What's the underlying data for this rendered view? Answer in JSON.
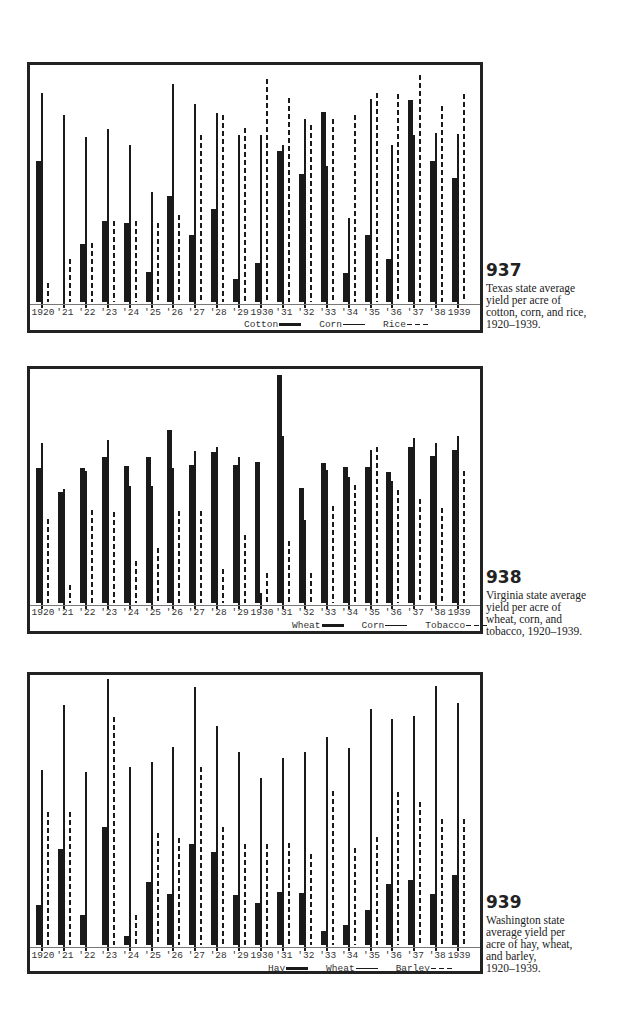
{
  "chart_data": [
    {
      "type": "bar",
      "id": "937",
      "title": "Texas state average yield per acre of cotton, corn, and rice, 1920–1939.",
      "categories": [
        "1920",
        "'21",
        "'22",
        "'23",
        "'24",
        "'25",
        "'26",
        "'27",
        "'28",
        "'29",
        "1930",
        "'31",
        "'32",
        "'33",
        "'34",
        "'35",
        "'36",
        "'37",
        "'38",
        "1939"
      ],
      "series": [
        {
          "name": "Cotton",
          "style": "thick",
          "values": [
            143,
            2,
            60,
            83,
            81,
            32,
            108,
            69,
            95,
            25,
            41,
            153,
            130,
            192,
            31,
            69,
            45,
            204,
            143,
            126
          ]
        },
        {
          "name": "Corn",
          "style": "thin",
          "values": [
            211,
            189,
            167,
            175,
            159,
            112,
            220,
            200,
            191,
            169,
            169,
            159,
            185,
            138,
            86,
            205,
            159,
            169,
            171,
            170
          ]
        },
        {
          "name": "Rice",
          "style": "dashed",
          "values": [
            21,
            45,
            61,
            83,
            83,
            81,
            89,
            169,
            189,
            176,
            225,
            206,
            179,
            185,
            189,
            211,
            210,
            229,
            198,
            210
          ]
        }
      ],
      "xlabel": "",
      "ylabel": "",
      "grid": false,
      "legend_position": "bottom-right",
      "units_note": "relative bar heights (no y-axis scale shown)"
    },
    {
      "type": "bar",
      "id": "938",
      "title": "Virginia state average yield per acre of wheat, corn, and tobacco, 1920–1939.",
      "categories": [
        "1920",
        "'21",
        "'22",
        "'23",
        "'24",
        "'25",
        "'26",
        "'27",
        "'28",
        "'29",
        "1930",
        "'31",
        "'32",
        "'33",
        "'34",
        "'35",
        "'36",
        "'37",
        "'38",
        "1939"
      ],
      "series": [
        {
          "name": "Wheat",
          "style": "thick",
          "values": [
            137,
            113,
            137,
            148,
            139,
            148,
            175,
            140,
            153,
            140,
            143,
            230,
            117,
            142,
            138,
            138,
            133,
            158,
            149,
            155
          ]
        },
        {
          "name": "Corn",
          "style": "thin",
          "values": [
            162,
            116,
            134,
            165,
            119,
            119,
            137,
            154,
            158,
            148,
            12,
            169,
            85,
            135,
            128,
            155,
            124,
            167,
            162,
            169
          ]
        },
        {
          "name": "Tobacco",
          "style": "dashed",
          "values": [
            86,
            20,
            95,
            93,
            44,
            57,
            94,
            94,
            36,
            70,
            32,
            64,
            32,
            99,
            120,
            158,
            115,
            106,
            97,
            134
          ]
        }
      ],
      "xlabel": "",
      "ylabel": "",
      "grid": false,
      "legend_position": "bottom-right",
      "units_note": "relative bar heights (no y-axis scale shown)"
    },
    {
      "type": "bar",
      "id": "939",
      "title": "Washington state average yield per acre of hay, wheat, and barley, 1920–1939.",
      "categories": [
        "1920",
        "'21",
        "'22",
        "'23",
        "'24",
        "'25",
        "'26",
        "'27",
        "'28",
        "'29",
        "1930",
        "'31",
        "'32",
        "'33",
        "'34",
        "'35",
        "'36",
        "'37",
        "'38",
        "1939"
      ],
      "series": [
        {
          "name": "Hay",
          "style": "thick",
          "values": [
            42,
            98,
            32,
            120,
            11,
            65,
            53,
            103,
            95,
            52,
            44,
            55,
            54,
            16,
            22,
            37,
            63,
            67,
            53,
            72
          ]
        },
        {
          "name": "Wheat",
          "style": "thin",
          "values": [
            177,
            242,
            175,
            268,
            180,
            185,
            200,
            260,
            221,
            195,
            169,
            189,
            195,
            210,
            199,
            238,
            228,
            231,
            261,
            244
          ]
        },
        {
          "name": "Barley",
          "style": "dashed",
          "values": [
            135,
            135,
            2,
            230,
            32,
            114,
            109,
            180,
            120,
            103,
            103,
            104,
            93,
            156,
            99,
            110,
            155,
            145,
            128,
            128
          ]
        }
      ],
      "xlabel": "",
      "ylabel": "",
      "grid": false,
      "legend_position": "bottom-right",
      "units_note": "relative bar heights (no y-axis scale shown)"
    }
  ],
  "figures": [
    {
      "number": "937",
      "caption": "Texas state average yield per acre of cotton, corn, and rice, 1920–1939.",
      "caption_lines": [
        "Texas state average",
        "yield per acre of",
        "cotton, corn, and rice,",
        "1920–1939."
      ],
      "legend": [
        {
          "label": "Cotton",
          "swatch": "thick"
        },
        {
          "label": "Corn",
          "swatch": "thin"
        },
        {
          "label": "Rice",
          "swatch": "dash"
        }
      ]
    },
    {
      "number": "938",
      "caption": "Virginia state average yield per acre of wheat, corn, and tobacco, 1920–1939.",
      "caption_lines": [
        "Virginia state average",
        "yield per acre of",
        "wheat, corn, and",
        "tobacco, 1920–1939."
      ],
      "legend": [
        {
          "label": "Wheat",
          "swatch": "thick"
        },
        {
          "label": "Corn",
          "swatch": "thin"
        },
        {
          "label": "Tobacco",
          "swatch": "dash"
        }
      ]
    },
    {
      "number": "939",
      "caption": "Washington state average yield per acre of hay, wheat, and barley, 1920–1939.",
      "caption_lines": [
        "Washington state",
        "average yield per",
        "acre of hay, wheat,",
        "and barley,",
        "1920–1939."
      ],
      "legend": [
        {
          "label": "Hay",
          "swatch": "thick"
        },
        {
          "label": "Wheat",
          "swatch": "thin"
        },
        {
          "label": "Barley",
          "swatch": "dash"
        }
      ]
    }
  ],
  "colors": {
    "ink": "#1a1a1a",
    "frame": "#222222",
    "background": "#ffffff"
  }
}
